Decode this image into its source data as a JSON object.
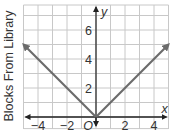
{
  "chart_data": {
    "type": "line",
    "title": "",
    "xlabel": "x",
    "ylabel": "Blocks From Library",
    "y_axis_name": "y",
    "origin_label": "O",
    "xlim": [
      -5,
      5
    ],
    "ylim": [
      -0.8,
      7.7
    ],
    "grid": true,
    "x_ticks": [
      -4,
      -2,
      2,
      4
    ],
    "x_tick_labels": [
      "−4",
      "−2",
      "2",
      "4"
    ],
    "y_ticks": [
      2,
      4,
      6
    ],
    "y_tick_labels": [
      "2",
      "4",
      "6"
    ],
    "series": [
      {
        "name": "y = |x|",
        "x": [
          -5,
          0,
          5
        ],
        "y": [
          5,
          0,
          5
        ],
        "color": "#6b6b6b",
        "arrows": "both-ends"
      }
    ]
  },
  "colors": {
    "grid": "#c8c8c8",
    "axis": "#222222",
    "line": "#6b6b6b",
    "text": "#333333"
  }
}
